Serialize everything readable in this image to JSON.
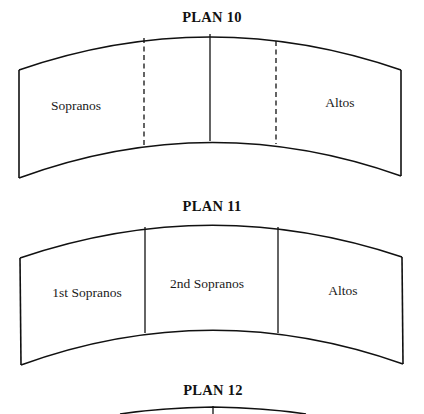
{
  "plans": [
    {
      "title": "PLAN 10",
      "sections": [
        {
          "label": "Sopranos"
        },
        {
          "label": ""
        },
        {
          "label": ""
        },
        {
          "label": "Altos"
        }
      ],
      "dividers": [
        "dashed",
        "solid",
        "dashed"
      ]
    },
    {
      "title": "PLAN 11",
      "sections": [
        {
          "label": "1st Sopranos"
        },
        {
          "label": "2nd Sopranos"
        },
        {
          "label": "Altos"
        }
      ],
      "dividers": [
        "solid",
        "solid"
      ]
    },
    {
      "title": "PLAN 12",
      "sections": [],
      "dividers": [
        "solid"
      ]
    }
  ],
  "colors": {
    "line": "#111111",
    "background": "#ffffff"
  }
}
